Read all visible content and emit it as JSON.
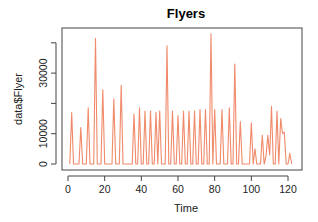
{
  "chart_data": {
    "type": "line",
    "title": "Flyers",
    "xlabel": "Time",
    "ylabel": "data$Flyer",
    "xlim": [
      0,
      123
    ],
    "ylim": [
      0,
      44000
    ],
    "x_ticks": [
      0,
      20,
      40,
      60,
      80,
      100,
      120
    ],
    "y_ticks": [
      0,
      10000,
      20000,
      30000,
      40000
    ],
    "y_tick_labels_shown": [
      "0",
      "10000",
      "30000"
    ],
    "grid": false,
    "legend": null,
    "line_color": "#f08a6a",
    "series": [
      {
        "name": "data$Flyer",
        "x": [
          1,
          2,
          3,
          4,
          5,
          6,
          7,
          8,
          9,
          10,
          11,
          12,
          13,
          14,
          15,
          16,
          17,
          18,
          19,
          20,
          21,
          22,
          23,
          24,
          25,
          26,
          27,
          28,
          29,
          30,
          31,
          32,
          33,
          34,
          35,
          36,
          37,
          38,
          39,
          40,
          41,
          42,
          43,
          44,
          45,
          46,
          47,
          48,
          49,
          50,
          51,
          52,
          53,
          54,
          55,
          56,
          57,
          58,
          59,
          60,
          61,
          62,
          63,
          64,
          65,
          66,
          67,
          68,
          69,
          70,
          71,
          72,
          73,
          74,
          75,
          76,
          77,
          78,
          79,
          80,
          81,
          82,
          83,
          84,
          85,
          86,
          87,
          88,
          89,
          90,
          91,
          92,
          93,
          94,
          95,
          96,
          97,
          98,
          99,
          100,
          101,
          102,
          103,
          104,
          105,
          106,
          107,
          108,
          109,
          110,
          111,
          112,
          113,
          114,
          115,
          116,
          117,
          118,
          119,
          120,
          121,
          122
        ],
        "values": [
          0,
          17000,
          0,
          0,
          0,
          0,
          12000,
          0,
          0,
          0,
          18500,
          0,
          0,
          0,
          41500,
          0,
          0,
          0,
          24500,
          0,
          0,
          0,
          0,
          0,
          21500,
          0,
          0,
          0,
          26000,
          0,
          0,
          0,
          0,
          0,
          0,
          16500,
          0,
          0,
          18500,
          0,
          0,
          17500,
          0,
          0,
          17500,
          0,
          0,
          17000,
          0,
          17500,
          0,
          0,
          0,
          39000,
          0,
          0,
          17500,
          0,
          0,
          16000,
          0,
          0,
          17500,
          0,
          0,
          17500,
          0,
          0,
          17500,
          0,
          0,
          18000,
          0,
          0,
          18000,
          0,
          0,
          43000,
          0,
          18000,
          0,
          0,
          0,
          18000,
          0,
          0,
          0,
          18500,
          0,
          0,
          33000,
          0,
          0,
          14000,
          0,
          0,
          0,
          0,
          0,
          13500,
          0,
          5000,
          0,
          0,
          0,
          9500,
          0,
          2500,
          9500,
          3000,
          19000,
          0,
          0,
          17500,
          0,
          15000,
          10000,
          10500,
          0,
          0,
          3500,
          0
        ]
      }
    ]
  }
}
